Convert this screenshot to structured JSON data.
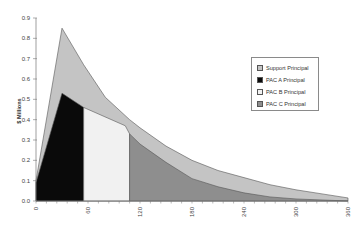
{
  "chart_data": {
    "type": "area",
    "title": "",
    "xlabel": "",
    "ylabel": "$ Millions",
    "xlim": [
      0,
      360
    ],
    "ylim": [
      0,
      0.9
    ],
    "x_ticks": [
      "0",
      "60",
      "120",
      "180",
      "240",
      "300",
      "360"
    ],
    "y_ticks": [
      "0.0",
      "0.1",
      "0.2",
      "0.3",
      "0.4",
      "0.5",
      "0.6",
      "0.7",
      "0.8",
      "0.9"
    ],
    "grid": false,
    "legend_position": "right",
    "stacked": true,
    "series": [
      {
        "name": "PAC A Principal",
        "color": "#0a0a0a",
        "points": [
          [
            0,
            0.09
          ],
          [
            30,
            0.53
          ],
          [
            55,
            0.46
          ],
          [
            55,
            0
          ]
        ]
      },
      {
        "name": "PAC B Principal",
        "color": "#f1f1f1",
        "points": [
          [
            55,
            0.46
          ],
          [
            103,
            0.37
          ],
          [
            108,
            0.33
          ],
          [
            108,
            0
          ]
        ]
      },
      {
        "name": "PAC C Principal",
        "color": "#8e8e8e",
        "points": [
          [
            108,
            0.33
          ],
          [
            120,
            0.28
          ],
          [
            150,
            0.19
          ],
          [
            180,
            0.11
          ],
          [
            210,
            0.07
          ],
          [
            240,
            0.04
          ],
          [
            270,
            0.02
          ],
          [
            300,
            0.01
          ],
          [
            330,
            0.005
          ],
          [
            360,
            0.0
          ]
        ]
      },
      {
        "name": "Support Principal",
        "color": "#c4c4c4",
        "description": "Total (support + PAC) envelope",
        "total_points": [
          [
            0,
            0.1
          ],
          [
            30,
            0.85
          ],
          [
            55,
            0.67
          ],
          [
            80,
            0.51
          ],
          [
            108,
            0.4
          ],
          [
            120,
            0.36
          ],
          [
            150,
            0.27
          ],
          [
            180,
            0.2
          ],
          [
            210,
            0.15
          ],
          [
            240,
            0.115
          ],
          [
            270,
            0.08
          ],
          [
            300,
            0.055
          ],
          [
            330,
            0.035
          ],
          [
            360,
            0.015
          ]
        ]
      }
    ]
  },
  "legend": {
    "items": [
      {
        "label": "Support Principal",
        "color": "#c4c4c4"
      },
      {
        "label": "PAC A Principal",
        "color": "#0a0a0a"
      },
      {
        "label": "PAC B Principal",
        "color": "#f1f1f1"
      },
      {
        "label": "PAC C Principal",
        "color": "#8e8e8e"
      }
    ]
  },
  "axes": {
    "ylabel": "$ Millions"
  }
}
